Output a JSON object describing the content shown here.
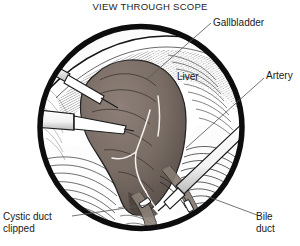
{
  "figure": {
    "title": "VIEW THROUGH SCOPE",
    "kind": "medical-illustration",
    "viewport_shape": "circle",
    "colors": {
      "ink": "#151515",
      "paper": "#ffffff",
      "gallbladder": "#7e7068",
      "gallbladder_shadow": "#5d524c",
      "liver": "#d8d4cf",
      "duct": "#8e8279",
      "instrument": "#ffffff",
      "leader_line": "#555555"
    }
  },
  "labels": {
    "gallbladder": "Gallbladder",
    "liver": "Liver",
    "artery": "Artery",
    "bile_duct": "Bile\nduct",
    "bile_duct_line1": "Bile",
    "bile_duct_line2": "duct",
    "cystic_duct_line1": "Cystic duct",
    "cystic_duct_line2": "clipped"
  },
  "scene": {
    "structures": [
      "gallbladder",
      "liver",
      "cystic artery",
      "cystic duct with clip",
      "common bile duct"
    ],
    "instruments": [
      "grasper-upper-left",
      "grasper-mid-left",
      "dissector-lower-right"
    ],
    "clips": 2
  }
}
